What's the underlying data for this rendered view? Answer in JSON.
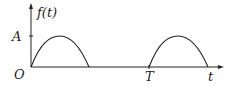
{
  "figure": {
    "type": "signal-plot",
    "y_axis_label": "f(t)",
    "x_axis_label": "t",
    "origin_label": "O",
    "amplitude_label": "A",
    "period_label": "T",
    "colors": {
      "line": "#222222",
      "background": "#ffffff"
    },
    "pulses": [
      {
        "start": "0",
        "end": "T/2",
        "shape": "half-sine",
        "peak": "A"
      },
      {
        "start": "T",
        "end": "3T/2",
        "shape": "half-sine",
        "peak": "A"
      }
    ]
  }
}
